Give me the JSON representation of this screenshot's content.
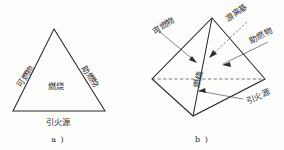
{
  "figure": {
    "title_alt": "燃烧三角形与燃烧四面体",
    "ink_color": "#26262a",
    "background_color": "#fdfdfc",
    "panels": [
      {
        "id": "a",
        "caption": "a )",
        "shape": "triangle",
        "labels": {
          "left_edge": "可燃物",
          "right_edge": "助燃物",
          "bottom_edge": "引火源",
          "center": "燃烧"
        }
      },
      {
        "id": "b",
        "caption": "b )",
        "shape": "tetrahedron",
        "labels": {
          "upper_left": "可燃物",
          "top_center": "游离基",
          "upper_right": "助燃物",
          "lower_right": "引火源",
          "center": "燃烧"
        }
      }
    ]
  }
}
